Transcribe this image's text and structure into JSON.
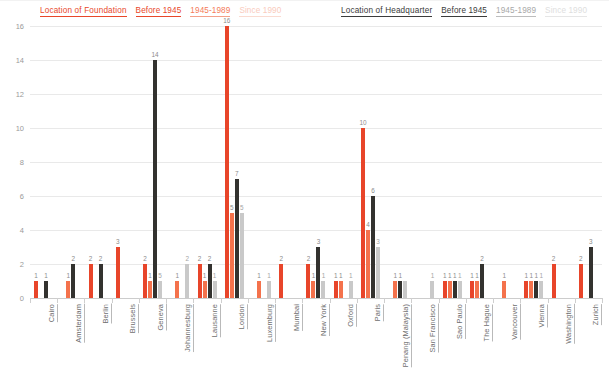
{
  "legend": {
    "foundation": {
      "title": "Location of Foundation",
      "items": [
        "Before 1945",
        "1945-1989",
        "Since 1990"
      ],
      "colors": [
        "#e8452a",
        "#f4724c",
        "#f9cbbd"
      ]
    },
    "headquarter": {
      "title": "Location of Headquarter",
      "items": [
        "Before 1945",
        "1945-1989",
        "Since 1990"
      ],
      "colors": [
        "#33322f",
        "#c9c9c9",
        "#e6e6e6"
      ]
    }
  },
  "chart_data": {
    "type": "bar",
    "title": "",
    "xlabel": "",
    "ylabel": "",
    "ylim": [
      0,
      16
    ],
    "yticks": [
      0,
      2,
      4,
      6,
      8,
      10,
      12,
      14,
      16
    ],
    "grid": true,
    "legend_position": "top",
    "categories": [
      "Cairo",
      "Amsterdam",
      "Berlin",
      "Brussels",
      "Geneva",
      "Johannesburg",
      "Lausanne",
      "London",
      "Luxemburg",
      "Mumbai",
      "New York",
      "Oxford",
      "Paris",
      "Penang (Malaysia)",
      "San Francisco",
      "Sao Paulo",
      "The Hague",
      "Vancouver",
      "Vienna",
      "Washington",
      "Zurich"
    ],
    "series": [
      {
        "name": "Location of Foundation - Before 1945",
        "color": "#e8452a",
        "values": [
          1,
          0,
          2,
          3,
          2,
          0,
          2,
          16,
          0,
          2,
          2,
          1,
          10,
          0,
          0,
          1,
          1,
          0,
          1,
          2,
          2
        ]
      },
      {
        "name": "Location of Foundation - 1945-1989",
        "color": "#f4724c",
        "values": [
          0,
          1,
          0,
          0,
          1,
          1,
          1,
          5,
          1,
          0,
          1,
          1,
          4,
          1,
          0,
          1,
          1,
          1,
          1,
          0,
          0
        ]
      },
      {
        "name": "Location of Headquarter - Before 1945",
        "color": "#33322f",
        "values": [
          1,
          2,
          2,
          0,
          14,
          0,
          2,
          7,
          0,
          0,
          3,
          0,
          6,
          1,
          0,
          1,
          2,
          0,
          1,
          0,
          3
        ]
      },
      {
        "name": "Location of Headquarter - 1945-1989",
        "color": "#c9c9c9",
        "values": [
          0,
          0,
          0,
          0,
          1,
          2,
          1,
          5,
          1,
          0,
          1,
          1,
          3,
          1,
          1,
          1,
          0,
          0,
          1,
          0,
          0
        ]
      }
    ],
    "bar_labels": {
      "Cairo": [
        {
          "s": 0,
          "v": 1
        },
        {
          "s": 2,
          "v": 1
        }
      ],
      "Amsterdam": [
        {
          "s": 1,
          "v": 1
        },
        {
          "s": 2,
          "v": 2
        }
      ],
      "Berlin": [
        {
          "s": 0,
          "v": 2
        },
        {
          "s": 2,
          "v": 2
        }
      ],
      "Brussels": [
        {
          "s": 0,
          "v": 3
        }
      ],
      "Geneva": [
        {
          "s": 0,
          "v": 2
        },
        {
          "s": 1,
          "v": 1
        },
        {
          "s": 2,
          "v": 14
        },
        {
          "s": 3,
          "v": 5
        }
      ],
      "Johannesburg": [
        {
          "s": 1,
          "v": 1
        },
        {
          "s": 3,
          "v": 2
        }
      ],
      "Lausanne": [
        {
          "s": 0,
          "v": 2
        },
        {
          "s": 1,
          "v": 1
        },
        {
          "s": 2,
          "v": 2
        },
        {
          "s": 3,
          "v": 1
        }
      ],
      "London": [
        {
          "s": 0,
          "v": 16
        },
        {
          "s": 1,
          "v": 5
        },
        {
          "s": 2,
          "v": 7
        },
        {
          "s": 3,
          "v": 5
        }
      ],
      "Luxemburg": [
        {
          "s": 1,
          "v": 1
        },
        {
          "s": 3,
          "v": 1
        }
      ],
      "Mumbai": [
        {
          "s": 0,
          "v": 2
        }
      ],
      "New York": [
        {
          "s": 0,
          "v": 2
        },
        {
          "s": 1,
          "v": 1
        },
        {
          "s": 2,
          "v": 3
        },
        {
          "s": 3,
          "v": 1
        }
      ],
      "Oxford": [
        {
          "s": 0,
          "v": 1
        },
        {
          "s": 1,
          "v": 1
        },
        {
          "s": 3,
          "v": 1
        }
      ],
      "Paris": [
        {
          "s": 0,
          "v": 10
        },
        {
          "s": 1,
          "v": 4
        },
        {
          "s": 2,
          "v": 6
        },
        {
          "s": 3,
          "v": 3
        }
      ],
      "Penang (Malaysia)": [
        {
          "s": 1,
          "v": 1
        },
        {
          "s": 2,
          "v": 1
        }
      ],
      "San Francisco": [
        {
          "s": 3,
          "v": 1
        }
      ],
      "Sao Paulo": [
        {
          "s": 0,
          "v": 1
        },
        {
          "s": 1,
          "v": 1
        },
        {
          "s": 2,
          "v": 1
        },
        {
          "s": 3,
          "v": 1
        }
      ],
      "The Hague": [
        {
          "s": 0,
          "v": 1
        },
        {
          "s": 1,
          "v": 1
        },
        {
          "s": 2,
          "v": 2
        }
      ],
      "Vancouver": [
        {
          "s": 1,
          "v": 1
        }
      ],
      "Vienna": [
        {
          "s": 0,
          "v": 1
        },
        {
          "s": 1,
          "v": 1
        },
        {
          "s": 2,
          "v": 1
        },
        {
          "s": 3,
          "v": 1
        }
      ],
      "Washington": [
        {
          "s": 0,
          "v": 2
        }
      ],
      "Zurich": [
        {
          "s": 0,
          "v": 2
        },
        {
          "s": 2,
          "v": 3
        }
      ]
    }
  }
}
